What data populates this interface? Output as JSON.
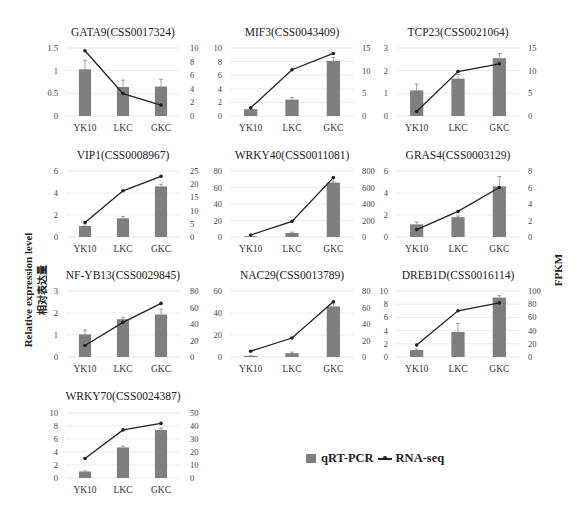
{
  "figure": {
    "left_axis_label_en": "Relative expression level",
    "left_axis_label_zh": "相对表达量",
    "right_axis_label": "FPKM",
    "legend": {
      "bar_label": "qRT-PCR",
      "line_label": "RNA-seq"
    },
    "colors": {
      "bar": "#7f7f7f",
      "line": "#222222",
      "grid": "#e6e6e6",
      "text": "#333333"
    }
  },
  "chart_data": [
    {
      "type": "bar+line",
      "title": "GATA9(CSS0017324)",
      "categories": [
        "YK10",
        "LKC",
        "GKC"
      ],
      "series": [
        {
          "name": "qRT-PCR",
          "axis": "left",
          "values": [
            1.03,
            0.64,
            0.65
          ],
          "errors": [
            0.2,
            0.15,
            0.16
          ]
        },
        {
          "name": "RNA-seq",
          "axis": "right",
          "values": [
            9.6,
            3.3,
            1.6
          ]
        }
      ],
      "left_ticks": [
        0,
        0.5,
        1,
        1.5
      ],
      "left_tick_labels": [
        "0",
        "0.5",
        "1",
        "1.5"
      ],
      "left_ylim": [
        0,
        1.5
      ],
      "right_ticks": [
        0,
        2,
        4,
        6,
        8,
        10
      ],
      "right_ylim": [
        0,
        10
      ]
    },
    {
      "type": "bar+line",
      "title": "MIF3(CSS0043409)",
      "categories": [
        "YK10",
        "LKC",
        "GKC"
      ],
      "series": [
        {
          "name": "qRT-PCR",
          "axis": "left",
          "values": [
            1.0,
            2.4,
            8.1
          ],
          "errors": [
            0.1,
            0.3,
            0.5
          ]
        },
        {
          "name": "RNA-seq",
          "axis": "right",
          "values": [
            1.8,
            10.2,
            13.8
          ]
        }
      ],
      "left_ticks": [
        0,
        2,
        4,
        6,
        8,
        10
      ],
      "left_ylim": [
        0,
        10
      ],
      "right_ticks": [
        0,
        5,
        10,
        15
      ],
      "right_ylim": [
        0,
        15
      ]
    },
    {
      "type": "bar+line",
      "title": "TCP23(CSS0021064)",
      "categories": [
        "YK10",
        "LKC",
        "GKC"
      ],
      "series": [
        {
          "name": "qRT-PCR",
          "axis": "left",
          "values": [
            1.13,
            1.65,
            2.55
          ],
          "errors": [
            0.28,
            0.18,
            0.2
          ]
        },
        {
          "name": "RNA-seq",
          "axis": "right",
          "values": [
            1.0,
            9.8,
            11.5
          ]
        }
      ],
      "left_ticks": [
        0,
        1,
        2,
        3
      ],
      "left_ylim": [
        0,
        3
      ],
      "right_ticks": [
        0,
        5,
        10,
        15
      ],
      "right_ylim": [
        0,
        15
      ]
    },
    {
      "type": "bar+line",
      "title": "VIP1(CSS0008967)",
      "categories": [
        "YK10",
        "LKC",
        "GKC"
      ],
      "series": [
        {
          "name": "qRT-PCR",
          "axis": "left",
          "values": [
            1.0,
            1.7,
            4.6
          ],
          "errors": [
            0.08,
            0.15,
            0.2
          ]
        },
        {
          "name": "RNA-seq",
          "axis": "right",
          "values": [
            5.5,
            17.5,
            23.0
          ]
        }
      ],
      "left_ticks": [
        0,
        2,
        4,
        6
      ],
      "left_ylim": [
        0,
        6
      ],
      "right_ticks": [
        0,
        5,
        10,
        15,
        20,
        25
      ],
      "right_ylim": [
        0,
        25
      ]
    },
    {
      "type": "bar+line",
      "title": "WRKY40(CSS0011081)",
      "categories": [
        "YK10",
        "LKC",
        "GKC"
      ],
      "series": [
        {
          "name": "qRT-PCR",
          "axis": "left",
          "values": [
            1.0,
            4.8,
            66
          ],
          "errors": [
            0.2,
            1.0,
            2.0
          ]
        },
        {
          "name": "RNA-seq",
          "axis": "right",
          "values": [
            25,
            190,
            720
          ]
        }
      ],
      "left_ticks": [
        0,
        20,
        40,
        60,
        80
      ],
      "left_ylim": [
        0,
        80
      ],
      "right_ticks": [
        0,
        200,
        400,
        600,
        800
      ],
      "right_ylim": [
        0,
        800
      ]
    },
    {
      "type": "bar+line",
      "title": "GRAS4(CSS0003129)",
      "categories": [
        "YK10",
        "LKC",
        "GKC"
      ],
      "series": [
        {
          "name": "qRT-PCR",
          "axis": "left",
          "values": [
            1.15,
            1.8,
            4.6
          ],
          "errors": [
            0.2,
            0.1,
            0.9
          ]
        },
        {
          "name": "RNA-seq",
          "axis": "right",
          "values": [
            0.9,
            3.1,
            6.0
          ]
        }
      ],
      "left_ticks": [
        0,
        2,
        4,
        6
      ],
      "left_ylim": [
        0,
        6
      ],
      "right_ticks": [
        0,
        2,
        4,
        6,
        8
      ],
      "right_ylim": [
        0,
        8
      ]
    },
    {
      "type": "bar+line",
      "title": "NF-YB13(CSS0029845)",
      "categories": [
        "YK10",
        "LKC",
        "GKC"
      ],
      "series": [
        {
          "name": "qRT-PCR",
          "axis": "left",
          "values": [
            1.03,
            1.72,
            1.93
          ],
          "errors": [
            0.2,
            0.08,
            0.25
          ]
        },
        {
          "name": "RNA-seq",
          "axis": "right",
          "values": [
            14,
            42,
            65
          ]
        }
      ],
      "left_ticks": [
        0,
        1,
        2,
        3
      ],
      "left_ylim": [
        0,
        3
      ],
      "right_ticks": [
        0,
        20,
        40,
        60,
        80
      ],
      "right_ylim": [
        0,
        80
      ]
    },
    {
      "type": "bar+line",
      "title": "NAC29(CSS0013789)",
      "categories": [
        "YK10",
        "LKC",
        "GKC"
      ],
      "series": [
        {
          "name": "qRT-PCR",
          "axis": "left",
          "values": [
            1.0,
            3.5,
            46
          ],
          "errors": [
            0.2,
            1.0,
            3.0
          ]
        },
        {
          "name": "RNA-seq",
          "axis": "right",
          "values": [
            7,
            23,
            67
          ]
        }
      ],
      "left_ticks": [
        0,
        20,
        40,
        60
      ],
      "left_ylim": [
        0,
        60
      ],
      "right_ticks": [
        0,
        20,
        40,
        60,
        80
      ],
      "right_ylim": [
        0,
        80
      ]
    },
    {
      "type": "bar+line",
      "title": "DREB1D(CSS0016114)",
      "categories": [
        "YK10",
        "LKC",
        "GKC"
      ],
      "series": [
        {
          "name": "qRT-PCR",
          "axis": "left",
          "values": [
            1.05,
            3.8,
            9.0
          ],
          "errors": [
            0.15,
            1.3,
            0.3
          ]
        },
        {
          "name": "RNA-seq",
          "axis": "right",
          "values": [
            18,
            70,
            82
          ]
        }
      ],
      "left_ticks": [
        0,
        2,
        4,
        6,
        8,
        10
      ],
      "left_ylim": [
        0,
        10
      ],
      "right_ticks": [
        0,
        20,
        40,
        60,
        80,
        100
      ],
      "right_ylim": [
        0,
        100
      ]
    },
    {
      "type": "bar+line",
      "title": "WRKY70(CSS0024387)",
      "categories": [
        "YK10",
        "LKC",
        "GKC"
      ],
      "series": [
        {
          "name": "qRT-PCR",
          "axis": "left",
          "values": [
            1.0,
            4.7,
            7.4
          ],
          "errors": [
            0.1,
            0.2,
            0.3
          ]
        },
        {
          "name": "RNA-seq",
          "axis": "right",
          "values": [
            15,
            37,
            42
          ]
        }
      ],
      "left_ticks": [
        0,
        2,
        4,
        6,
        8,
        10
      ],
      "left_ylim": [
        0,
        10
      ],
      "right_ticks": [
        0,
        10,
        20,
        30,
        40,
        50
      ],
      "right_ylim": [
        0,
        50
      ]
    }
  ]
}
